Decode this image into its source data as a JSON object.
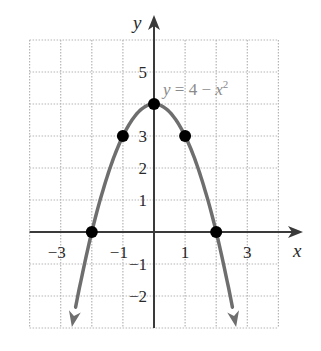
{
  "chart_data": {
    "type": "line",
    "title": "",
    "equation_label": {
      "lhs": "y",
      "eq": " = 4 − ",
      "var": "x",
      "exp": "2"
    },
    "xlabel": "x",
    "ylabel": "y",
    "xlim": [
      -4,
      4
    ],
    "ylim": [
      -3,
      6
    ],
    "grid": true,
    "x_tick_labels": [
      "−3",
      "−1",
      "1",
      "3"
    ],
    "x_tick_values": [
      -3,
      -1,
      1,
      3
    ],
    "y_tick_labels": [
      "5",
      "3",
      "2",
      "1",
      "−1",
      "−2"
    ],
    "y_tick_values": [
      5,
      3,
      2,
      1,
      -1,
      -2
    ],
    "series": [
      {
        "name": "y = 4 − x^2",
        "function": "4 - x^2",
        "x_range": [
          -2.64,
          2.64
        ],
        "arrows_at_ends": true,
        "color": "#6e6e6e"
      }
    ],
    "points": [
      {
        "x": -2,
        "y": 0
      },
      {
        "x": -1,
        "y": 3
      },
      {
        "x": 0,
        "y": 4
      },
      {
        "x": 1,
        "y": 3
      },
      {
        "x": 2,
        "y": 0
      }
    ],
    "colors": {
      "curve": "#6e6e6e",
      "points": "#000000",
      "axes": "#3a3a3a",
      "grid": "#b5b5b5",
      "label": "#8a8a8a"
    }
  }
}
